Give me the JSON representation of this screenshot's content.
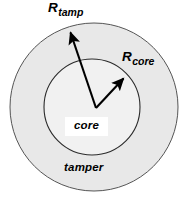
{
  "figure": {
    "background_color": "#ffffff"
  },
  "regions": {
    "tamper": {
      "label": "tamper",
      "fill_color": "#e8e8e8",
      "stroke_color": "#4a4a4a",
      "center_x": 94,
      "center_y": 107,
      "radius": 84
    },
    "core": {
      "label": "core",
      "fill_color": "#f2f2f2",
      "stroke_color": "#2b2b2b",
      "center_x": 92,
      "center_y": 107,
      "radius": 48
    }
  },
  "radius_arrows": [
    {
      "name": "R_tamp",
      "symbol": "R",
      "subscript": "tamp",
      "from_x": 96,
      "from_y": 108,
      "to_x": 68,
      "to_y": 30,
      "color": "#000000"
    },
    {
      "name": "R_core",
      "symbol": "R",
      "subscript": "core",
      "from_x": 96,
      "from_y": 108,
      "to_x": 126,
      "to_y": 76,
      "color": "#000000"
    }
  ],
  "labels": {
    "core_box_text": "core",
    "tamper_text": "tamper"
  }
}
